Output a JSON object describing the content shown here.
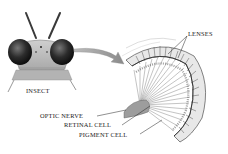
{
  "diagram": {
    "labels": {
      "insect": "INSECT",
      "lenses": "LENSES",
      "optic_nerve": "OPTIC NERVE",
      "retinal_cell": "RETINAL CELL",
      "pigment_cell": "PIGMENT CELL"
    },
    "colors": {
      "background": "#ffffff",
      "ink": "#1a1a1a",
      "eye_dark": "#2a2a2a",
      "head_gray": "#b8b8b8",
      "arrow_gray": "#9a9a9a"
    }
  }
}
